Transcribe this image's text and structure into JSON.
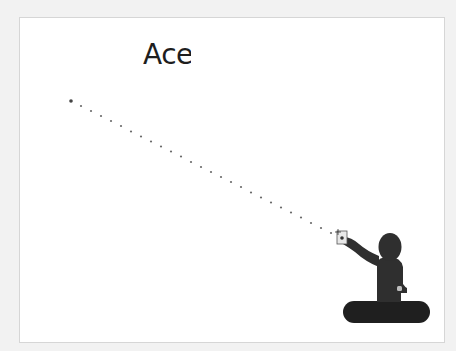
{
  "illustration": {
    "title_text": "Ace",
    "colors": {
      "page_background": "#f2f2f2",
      "panel_background": "#ffffff",
      "panel_border": "#d6d6d6",
      "figure": "#2f2f2f",
      "base": "#1f1f1f",
      "dots": "#555555",
      "card": "#e6e6e6"
    },
    "elements": {
      "pointer_line": "dotted-trajectory-line",
      "target_point": "start-dot",
      "figure": "person-pointing-figure",
      "card": "held-card",
      "base": "rounded-base"
    }
  }
}
